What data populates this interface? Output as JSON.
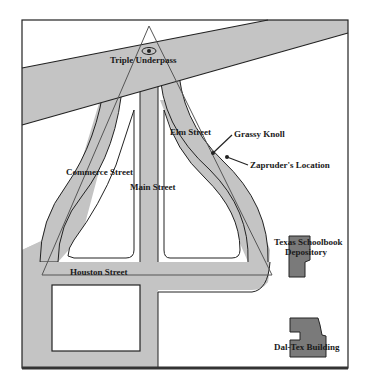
{
  "map": {
    "title": "Dealey Plaza",
    "colors": {
      "road": "#c4c4c4",
      "building": "#7a7a7a",
      "outline": "#222222",
      "background": "#ffffff"
    },
    "labels": {
      "triple_underpass": "Triple Underpass",
      "elm_street": "Elm Street",
      "grassy_knoll": "Grassy Knoll",
      "zapruder_location": "Zapruder's Location",
      "commerce_street": "Commerce Street",
      "main_street": "Main Street",
      "houston_street": "Houston Street",
      "texas_schoolbook_line1": "Texas Schoolbook",
      "texas_schoolbook_line2": "Depository",
      "dal_tex_building": "Dal-Tex Building"
    },
    "markers": [
      {
        "name": "grassy-knoll-marker",
        "x": 213,
        "y": 153
      },
      {
        "name": "zapruder-marker",
        "x": 227,
        "y": 157
      }
    ],
    "icons": {
      "eye": "eye-icon"
    }
  }
}
